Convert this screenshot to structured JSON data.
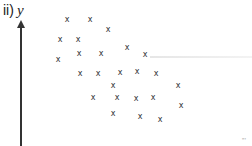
{
  "figure": {
    "label_prefix": "ii)",
    "axis_var": "y",
    "corner_mark": "”’"
  },
  "chart_data": {
    "type": "scatter",
    "xlabel": "",
    "ylabel": "y",
    "marker": "x",
    "grid": false,
    "legend": null,
    "trend": "negative correlation",
    "points_px": [
      [
        67,
        20
      ],
      [
        90,
        20
      ],
      [
        108,
        30
      ],
      [
        60,
        40
      ],
      [
        78,
        40
      ],
      [
        127,
        48
      ],
      [
        79,
        54
      ],
      [
        101,
        54
      ],
      [
        145,
        55
      ],
      [
        58,
        60
      ],
      [
        80,
        74
      ],
      [
        98,
        74
      ],
      [
        120,
        73
      ],
      [
        137,
        72
      ],
      [
        156,
        74
      ],
      [
        113,
        86
      ],
      [
        178,
        86
      ],
      [
        93,
        98
      ],
      [
        117,
        98
      ],
      [
        136,
        99
      ],
      [
        153,
        98
      ],
      [
        181,
        106
      ],
      [
        113,
        114
      ],
      [
        140,
        117
      ],
      [
        160,
        120
      ]
    ]
  }
}
